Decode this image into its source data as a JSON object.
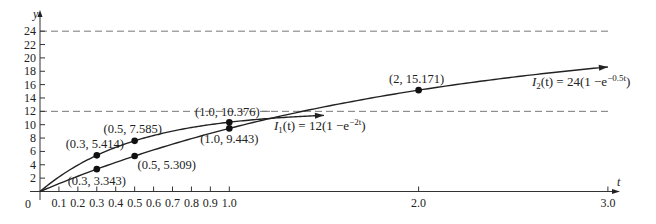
{
  "chart_data": {
    "type": "line",
    "title": "",
    "xlabel": "t",
    "ylabel": "y",
    "xlim": [
      0,
      3.0
    ],
    "ylim": [
      0,
      24
    ],
    "grid": false,
    "x_ticks": [
      "0.1",
      "0.2",
      "0.3",
      "0.4",
      "0.5",
      "0.6",
      "0.7",
      "0.8",
      "0.9",
      "1.0",
      "2.0",
      "3.0"
    ],
    "x_tick_values": [
      0.1,
      0.2,
      0.3,
      0.4,
      0.5,
      0.6,
      0.7,
      0.8,
      0.9,
      1.0,
      2.0,
      3.0
    ],
    "y_ticks": [
      "2",
      "4",
      "6",
      "8",
      "10",
      "12",
      "14",
      "16",
      "18",
      "20",
      "22",
      "24"
    ],
    "y_tick_values": [
      2,
      4,
      6,
      8,
      10,
      12,
      14,
      16,
      18,
      20,
      22,
      24
    ],
    "origin_label": "0",
    "asymptotes": [
      {
        "y": 12,
        "style": "dashed"
      },
      {
        "y": 24,
        "style": "dashed"
      }
    ],
    "series": [
      {
        "name": "I1(t) = 12(1 - e^(-2t))",
        "label_main": "I",
        "label_sub": "1",
        "label_rest": "(t) = 12(1 −e",
        "label_exp": "−2t",
        "label_close": ")",
        "amplitude": 12,
        "rate": 2,
        "t_end": 1.5,
        "points": [
          {
            "x": 0.3,
            "y": 5.414,
            "label": "(0.3, 5.414)"
          },
          {
            "x": 0.5,
            "y": 7.585,
            "label": "(0.5, 7.585)"
          },
          {
            "x": 1.0,
            "y": 10.376,
            "label": "(1.0, 10.376)"
          }
        ]
      },
      {
        "name": "I2(t) = 24(1 - e^(-0.5t))",
        "label_main": "I",
        "label_sub": "2",
        "label_rest": "(t) = 24(1 −e",
        "label_exp": "−0.5t",
        "label_close": ")",
        "amplitude": 24,
        "rate": 0.5,
        "t_end": 3.0,
        "points": [
          {
            "x": 0.3,
            "y": 3.343,
            "label": "(0.3, 3.343)"
          },
          {
            "x": 0.5,
            "y": 5.309,
            "label": "(0.5, 5.309)"
          },
          {
            "x": 1.0,
            "y": 9.443,
            "label": "(1.0, 9.443)"
          },
          {
            "x": 2.0,
            "y": 15.171,
            "label": "(2, 15.171)"
          }
        ]
      }
    ]
  }
}
